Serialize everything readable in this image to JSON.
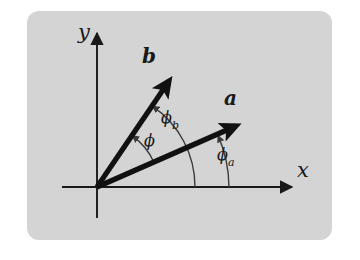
{
  "figure": {
    "kind": "vector-angle-diagram",
    "panel": {
      "fill_color": "#d4d4d4",
      "corner_radius_px": 12,
      "x": 27,
      "y": 11,
      "width": 305,
      "height": 229
    },
    "page_background_color": "#ffffff",
    "stroke_color": "#191919"
  },
  "axes": {
    "origin": {
      "x": 97,
      "y": 187
    },
    "x_axis": {
      "label": "x",
      "label_x": 297,
      "label_y": 160,
      "start_x": 62,
      "end_x": 297,
      "y": 187
    },
    "y_axis": {
      "label": "y",
      "label_x": 78,
      "label_y": 22,
      "x": 97,
      "start_y": 218,
      "end_y": 28
    }
  },
  "vectors": [
    {
      "name": "b",
      "label": "b",
      "label_x": 142,
      "label_y": 46,
      "tip_x": 178,
      "tip_y": 69,
      "angle_deg": 55.6,
      "stroke_width": 5
    },
    {
      "name": "a",
      "label": "a",
      "label_x": 224,
      "label_y": 88,
      "tip_x": 245,
      "tip_y": 119,
      "angle_deg": 23.5,
      "stroke_width": 5
    }
  ],
  "angles": [
    {
      "name": "phi",
      "label": "ϕ",
      "subscript": "",
      "label_x": 144,
      "label_y": 133,
      "radius": 62,
      "from_deg": 23.5,
      "to_deg": 55.6,
      "from_vector": "a",
      "to_vector": "b"
    },
    {
      "name": "phi_b",
      "label": "ϕ",
      "subscript": "b",
      "label_x": 161,
      "label_y": 110,
      "radius": 98,
      "from_deg": 0,
      "to_deg": 55.6,
      "from_vector": "x-axis",
      "to_vector": "b"
    },
    {
      "name": "phi_a",
      "label": "ϕ",
      "subscript": "a",
      "label_x": 217,
      "label_y": 147,
      "radius": 132,
      "from_deg": 0,
      "to_deg": 23.5,
      "from_vector": "x-axis",
      "to_vector": "a"
    }
  ]
}
